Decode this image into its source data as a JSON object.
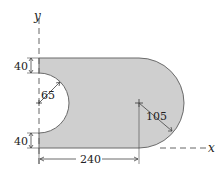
{
  "diagram": {
    "type": "engineering-plate-with-cutout",
    "colors": {
      "fill": "#cfcfcf",
      "outline": "#6a6a6a",
      "dimension_line": "#444444",
      "axis": "#666666",
      "text": "#222222"
    },
    "axes": {
      "x_label": "x",
      "y_label": "y"
    },
    "dimensions": {
      "top_offset": "40",
      "cutout_radius": "65",
      "bottom_offset": "40",
      "length": "240",
      "end_radius": "105"
    }
  }
}
